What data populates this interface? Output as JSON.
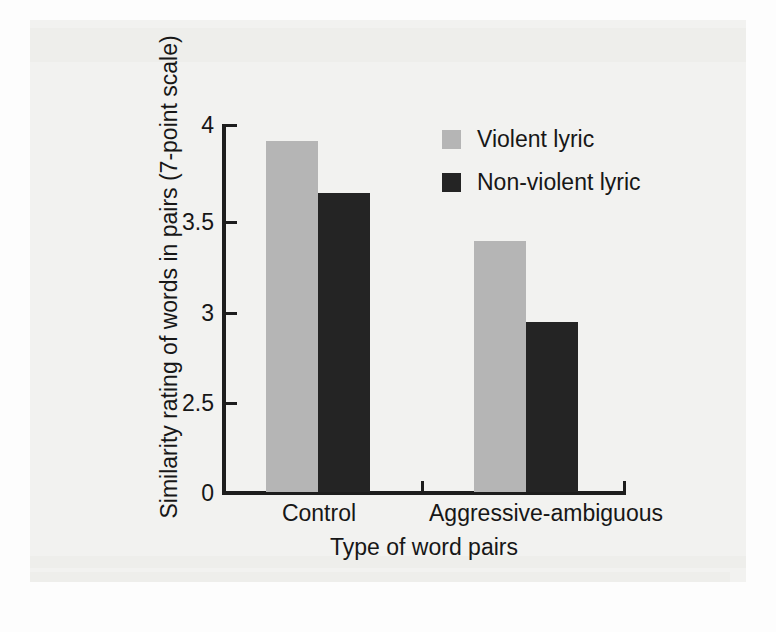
{
  "chart_data": {
    "type": "bar",
    "title": "",
    "subtitle": "",
    "xlabel": "Type of word pairs",
    "ylabel": "Similarity rating of words in pairs (7-point scale)",
    "categories": [
      "Control",
      "Aggressive-ambiguous"
    ],
    "series": [
      {
        "name": "Violent lyric",
        "color": "#b5b5b5",
        "values": [
          3.9,
          3.38
        ]
      },
      {
        "name": "Non-violent lyric",
        "color": "#242424",
        "values": [
          3.62,
          2.94
        ]
      }
    ],
    "yticks": [
      "0",
      "2.5",
      "3",
      "3.5",
      "4"
    ],
    "ytick_values": [
      0,
      2.5,
      3,
      3.5,
      4
    ],
    "ylim": [
      2.5,
      4
    ],
    "y_axis_broken": true,
    "grid": false,
    "legend_position": "top-right"
  },
  "axis": {
    "y": {
      "label": "Similarity rating of words in pairs (7-point scale)",
      "ticks": {
        "t4": "4",
        "t35": "3.5",
        "t3": "3",
        "t25": "2.5",
        "t0": "0"
      }
    },
    "x": {
      "label": "Type of word pairs",
      "categories": {
        "control": "Control",
        "aggressive": "Aggressive-ambiguous"
      }
    }
  },
  "legend": {
    "items": [
      {
        "label": "Violent lyric",
        "color": "#b5b5b5"
      },
      {
        "label": "Non-violent lyric",
        "color": "#242424"
      }
    ]
  },
  "colors": {
    "violent": "#b5b5b5",
    "nonviolent": "#242424",
    "axis": "#1d1d1d",
    "text": "#171717",
    "page_background": "#f2f2f0"
  }
}
